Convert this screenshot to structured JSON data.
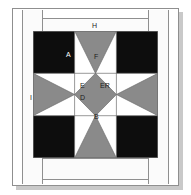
{
  "diagram": {
    "type": "quilt-block-piecing-diagram",
    "title": "",
    "palette": {
      "dark": "#0d0d0d",
      "medium": "#8a8a8a",
      "light": "#ffffff",
      "line": "#6e6e6e",
      "band_fill": "#fbfbfb",
      "page": "#ffffff",
      "shadow": "#c9c9c9"
    },
    "borders": [
      {
        "id": "H",
        "label": "H",
        "position": "top",
        "fill": "#fbfbfb"
      },
      {
        "id": "I",
        "label": "I",
        "position": "left",
        "fill": "#fbfbfb"
      }
    ],
    "patch_labels": [
      {
        "id": "A",
        "label": "A",
        "patch": "corner-square",
        "fill": "#0d0d0d",
        "text_color": "light"
      },
      {
        "id": "F",
        "label": "F",
        "patch": "top-center-triangle",
        "fill": "#8a8a8a",
        "text_color": "dark"
      },
      {
        "id": "E",
        "label": "E",
        "patch": "left-wing-triangle",
        "fill": "#ffffff",
        "text_color": "dark"
      },
      {
        "id": "ER",
        "label": "ER",
        "patch": "right-wing-triangle",
        "fill": "#ffffff",
        "text_color": "dark"
      },
      {
        "id": "D",
        "label": "D",
        "patch": "center-corner-triangle",
        "fill": "#ffffff",
        "text_color": "dark"
      },
      {
        "id": "B",
        "label": "B",
        "patch": "center-square-on-point",
        "fill": "#8a8a8a",
        "text_color": "dark"
      }
    ],
    "grid": {
      "rows": 3,
      "cols": 3,
      "cells": [
        {
          "row": 0,
          "col": 0,
          "unit": "solid-dark"
        },
        {
          "row": 0,
          "col": 1,
          "unit": "hourglass-vertical"
        },
        {
          "row": 0,
          "col": 2,
          "unit": "solid-dark"
        },
        {
          "row": 1,
          "col": 0,
          "unit": "hourglass-horizontal"
        },
        {
          "row": 1,
          "col": 1,
          "unit": "square-on-point"
        },
        {
          "row": 1,
          "col": 2,
          "unit": "hourglass-horizontal"
        },
        {
          "row": 2,
          "col": 0,
          "unit": "solid-dark"
        },
        {
          "row": 2,
          "col": 1,
          "unit": "hourglass-vertical"
        },
        {
          "row": 2,
          "col": 2,
          "unit": "solid-dark"
        }
      ]
    }
  }
}
